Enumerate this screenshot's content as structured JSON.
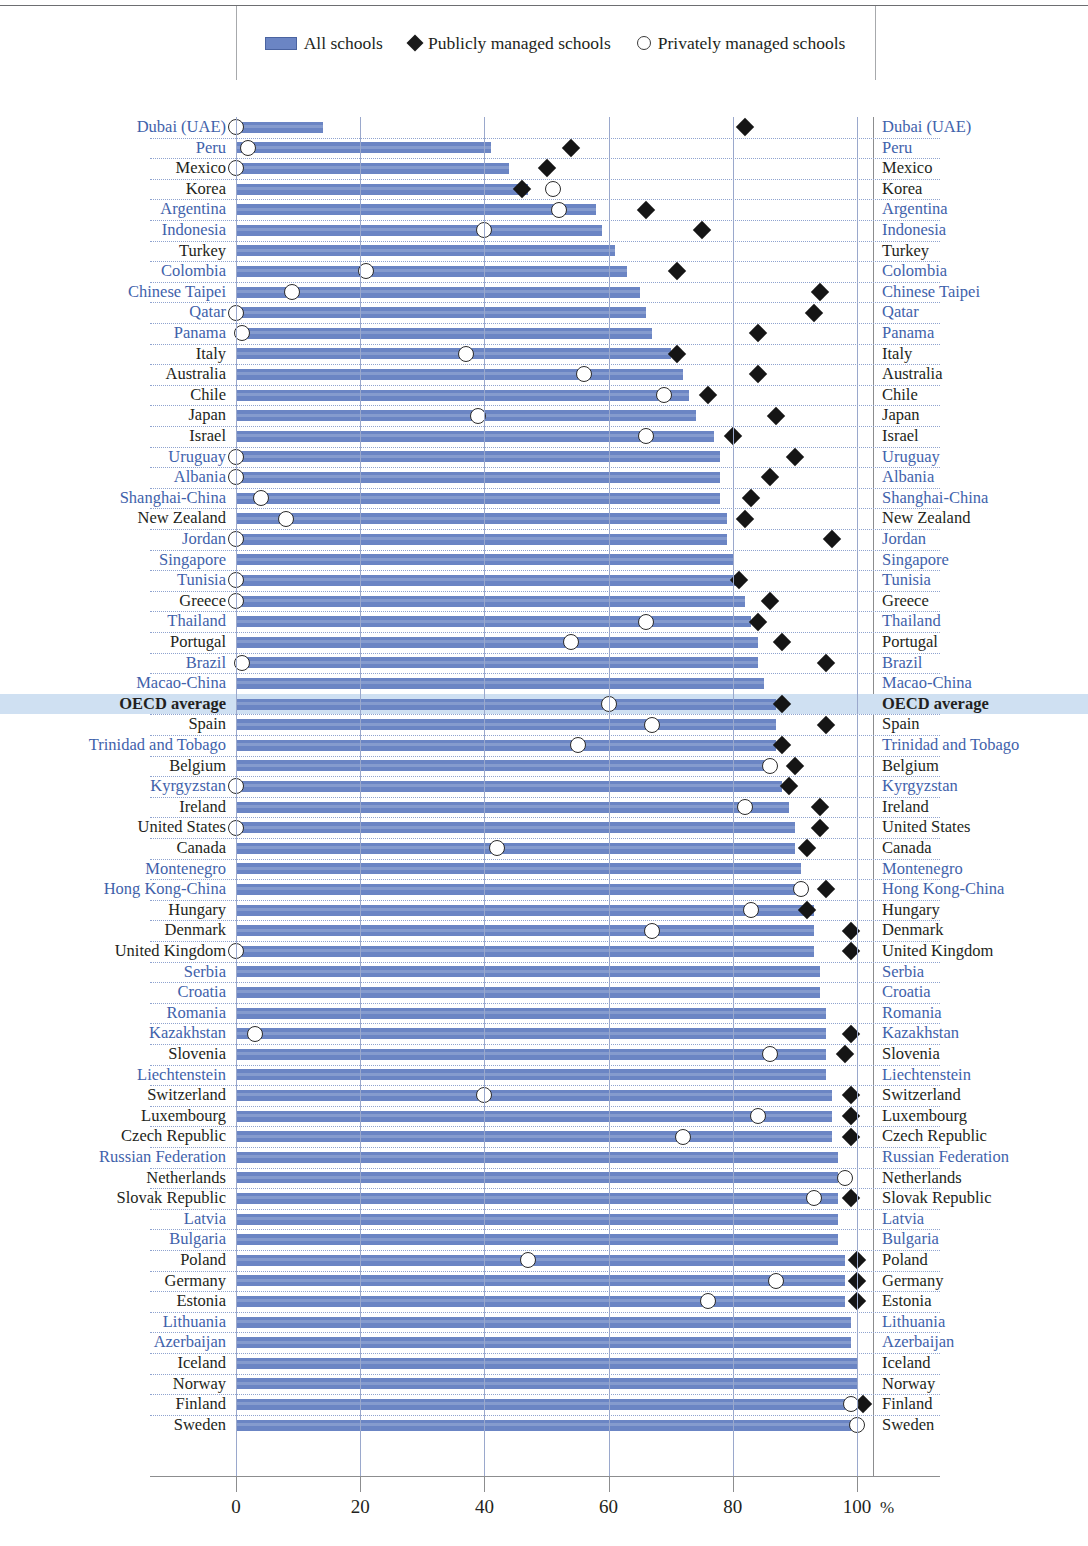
{
  "legend": {
    "items": [
      {
        "key": "all",
        "label": "All schools",
        "marker": "bar-swatch"
      },
      {
        "key": "public",
        "label": "Publicly managed schools",
        "marker": "filled-diamond"
      },
      {
        "key": "private",
        "label": "Privately managed schools",
        "marker": "open-circle"
      }
    ]
  },
  "axis": {
    "ticks": [
      "0",
      "20",
      "40",
      "60",
      "80",
      "100"
    ],
    "unit": "%",
    "min": 0,
    "max": 100
  },
  "chart_data": {
    "type": "bar",
    "title": "",
    "subtitle": "",
    "xlabel": "%",
    "ylabel": "",
    "xlim": [
      0,
      100
    ],
    "grid": "vertical gridlines at 0,20,40,60,80,100; dotted horizontal row separators",
    "legend_position": "top-center",
    "orientation": "horizontal",
    "series": [
      {
        "name": "All schools",
        "marker": "bar"
      },
      {
        "name": "Publicly managed schools",
        "marker": "filled-diamond"
      },
      {
        "name": "Privately managed schools",
        "marker": "open-circle"
      }
    ],
    "highlighted_category": "OECD average",
    "categories": [
      "Dubai (UAE)",
      "Peru",
      "Mexico",
      "Korea",
      "Argentina",
      "Indonesia",
      "Turkey",
      "Colombia",
      "Chinese Taipei",
      "Qatar",
      "Panama",
      "Italy",
      "Australia",
      "Chile",
      "Japan",
      "Israel",
      "Uruguay",
      "Albania",
      "Shanghai-China",
      "New Zealand",
      "Jordan",
      "Singapore",
      "Tunisia",
      "Greece",
      "Thailand",
      "Portugal",
      "Brazil",
      "Macao-China",
      "OECD average",
      "Spain",
      "Trinidad and Tobago",
      "Belgium",
      "Kyrgyzstan",
      "Ireland",
      "United States",
      "Canada",
      "Montenegro",
      "Hong Kong-China",
      "Hungary",
      "Denmark",
      "United Kingdom",
      "Serbia",
      "Croatia",
      "Romania",
      "Kazakhstan",
      "Slovenia",
      "Liechtenstein",
      "Switzerland",
      "Luxembourg",
      "Czech Republic",
      "Russian Federation",
      "Netherlands",
      "Slovak Republic",
      "Latvia",
      "Bulgaria",
      "Poland",
      "Germany",
      "Estonia",
      "Lithuania",
      "Azerbaijan",
      "Iceland",
      "Norway",
      "Finland",
      "Sweden"
    ],
    "rows": [
      {
        "category": "Dubai (UAE)",
        "non_oecd": true,
        "all": 14,
        "public": 82,
        "private": 0
      },
      {
        "category": "Peru",
        "non_oecd": true,
        "all": 41,
        "public": 54,
        "private": 2
      },
      {
        "category": "Mexico",
        "non_oecd": false,
        "all": 44,
        "public": 50,
        "private": 0
      },
      {
        "category": "Korea",
        "non_oecd": false,
        "all": 47,
        "public": 46,
        "private": 51
      },
      {
        "category": "Argentina",
        "non_oecd": true,
        "all": 58,
        "public": 66,
        "private": 52
      },
      {
        "category": "Indonesia",
        "non_oecd": true,
        "all": 59,
        "public": 75,
        "private": 40
      },
      {
        "category": "Turkey",
        "non_oecd": false,
        "all": 61,
        "public": null,
        "private": null
      },
      {
        "category": "Colombia",
        "non_oecd": true,
        "all": 63,
        "public": 71,
        "private": 21
      },
      {
        "category": "Chinese Taipei",
        "non_oecd": true,
        "all": 65,
        "public": 94,
        "private": 9
      },
      {
        "category": "Qatar",
        "non_oecd": true,
        "all": 66,
        "public": 93,
        "private": 0
      },
      {
        "category": "Panama",
        "non_oecd": true,
        "all": 67,
        "public": 84,
        "private": 1
      },
      {
        "category": "Italy",
        "non_oecd": false,
        "all": 70,
        "public": 71,
        "private": 37
      },
      {
        "category": "Australia",
        "non_oecd": false,
        "all": 72,
        "public": 84,
        "private": 56
      },
      {
        "category": "Chile",
        "non_oecd": false,
        "all": 73,
        "public": 76,
        "private": 69
      },
      {
        "category": "Japan",
        "non_oecd": false,
        "all": 74,
        "public": 87,
        "private": 39
      },
      {
        "category": "Israel",
        "non_oecd": false,
        "all": 77,
        "public": 80,
        "private": 66
      },
      {
        "category": "Uruguay",
        "non_oecd": true,
        "all": 78,
        "public": 90,
        "private": 0
      },
      {
        "category": "Albania",
        "non_oecd": true,
        "all": 78,
        "public": 86,
        "private": 0
      },
      {
        "category": "Shanghai-China",
        "non_oecd": true,
        "all": 78,
        "public": 83,
        "private": 4
      },
      {
        "category": "New Zealand",
        "non_oecd": false,
        "all": 79,
        "public": 82,
        "private": 8
      },
      {
        "category": "Jordan",
        "non_oecd": true,
        "all": 79,
        "public": 96,
        "private": 0
      },
      {
        "category": "Singapore",
        "non_oecd": true,
        "all": 80,
        "public": null,
        "private": null
      },
      {
        "category": "Tunisia",
        "non_oecd": true,
        "all": 81,
        "public": 81,
        "private": 0
      },
      {
        "category": "Greece",
        "non_oecd": false,
        "all": 82,
        "public": 86,
        "private": 0
      },
      {
        "category": "Thailand",
        "non_oecd": true,
        "all": 83,
        "public": 84,
        "private": 66
      },
      {
        "category": "Portugal",
        "non_oecd": false,
        "all": 84,
        "public": 88,
        "private": 54
      },
      {
        "category": "Brazil",
        "non_oecd": true,
        "all": 84,
        "public": 95,
        "private": 1
      },
      {
        "category": "Macao-China",
        "non_oecd": true,
        "all": 85,
        "public": null,
        "private": null
      },
      {
        "category": "OECD average",
        "non_oecd": false,
        "all": 87,
        "public": 88,
        "private": 60
      },
      {
        "category": "Spain",
        "non_oecd": false,
        "all": 87,
        "public": 95,
        "private": 67
      },
      {
        "category": "Trinidad and Tobago",
        "non_oecd": true,
        "all": 87,
        "public": 88,
        "private": 55
      },
      {
        "category": "Belgium",
        "non_oecd": false,
        "all": 86,
        "public": 90,
        "private": 86
      },
      {
        "category": "Kyrgyzstan",
        "non_oecd": true,
        "all": 88,
        "public": 89,
        "private": 0
      },
      {
        "category": "Ireland",
        "non_oecd": false,
        "all": 89,
        "public": 94,
        "private": 82
      },
      {
        "category": "United States",
        "non_oecd": false,
        "all": 90,
        "public": 94,
        "private": 0
      },
      {
        "category": "Canada",
        "non_oecd": false,
        "all": 90,
        "public": 92,
        "private": 42
      },
      {
        "category": "Montenegro",
        "non_oecd": true,
        "all": 91,
        "public": null,
        "private": null
      },
      {
        "category": "Hong Kong-China",
        "non_oecd": true,
        "all": 92,
        "public": 95,
        "private": 91
      },
      {
        "category": "Hungary",
        "non_oecd": false,
        "all": 93,
        "public": 92,
        "private": 83
      },
      {
        "category": "Denmark",
        "non_oecd": false,
        "all": 93,
        "public": 99,
        "private": 67
      },
      {
        "category": "United Kingdom",
        "non_oecd": false,
        "all": 93,
        "public": 99,
        "private": 0
      },
      {
        "category": "Serbia",
        "non_oecd": true,
        "all": 94,
        "public": null,
        "private": null
      },
      {
        "category": "Croatia",
        "non_oecd": true,
        "all": 94,
        "public": null,
        "private": null
      },
      {
        "category": "Romania",
        "non_oecd": true,
        "all": 95,
        "public": null,
        "private": null
      },
      {
        "category": "Kazakhstan",
        "non_oecd": true,
        "all": 95,
        "public": 99,
        "private": 3
      },
      {
        "category": "Slovenia",
        "non_oecd": false,
        "all": 95,
        "public": 98,
        "private": 86
      },
      {
        "category": "Liechtenstein",
        "non_oecd": true,
        "all": 95,
        "public": null,
        "private": null
      },
      {
        "category": "Switzerland",
        "non_oecd": false,
        "all": 96,
        "public": 99,
        "private": 40
      },
      {
        "category": "Luxembourg",
        "non_oecd": false,
        "all": 96,
        "public": 99,
        "private": 84
      },
      {
        "category": "Czech Republic",
        "non_oecd": false,
        "all": 96,
        "public": 99,
        "private": 72
      },
      {
        "category": "Russian Federation",
        "non_oecd": true,
        "all": 97,
        "public": null,
        "private": null
      },
      {
        "category": "Netherlands",
        "non_oecd": false,
        "all": 97,
        "public": null,
        "private": 98
      },
      {
        "category": "Slovak Republic",
        "non_oecd": false,
        "all": 97,
        "public": 99,
        "private": 93
      },
      {
        "category": "Latvia",
        "non_oecd": true,
        "all": 97,
        "public": null,
        "private": null
      },
      {
        "category": "Bulgaria",
        "non_oecd": true,
        "all": 97,
        "public": null,
        "private": null
      },
      {
        "category": "Poland",
        "non_oecd": false,
        "all": 98,
        "public": 100,
        "private": 47
      },
      {
        "category": "Germany",
        "non_oecd": false,
        "all": 98,
        "public": 100,
        "private": 87
      },
      {
        "category": "Estonia",
        "non_oecd": false,
        "all": 98,
        "public": 100,
        "private": 76
      },
      {
        "category": "Lithuania",
        "non_oecd": true,
        "all": 99,
        "public": null,
        "private": null
      },
      {
        "category": "Azerbaijan",
        "non_oecd": true,
        "all": 99,
        "public": null,
        "private": null
      },
      {
        "category": "Iceland",
        "non_oecd": false,
        "all": 100,
        "public": null,
        "private": null
      },
      {
        "category": "Norway",
        "non_oecd": false,
        "all": 100,
        "public": null,
        "private": null
      },
      {
        "category": "Finland",
        "non_oecd": false,
        "all": 100,
        "public": 101,
        "private": 99
      },
      {
        "category": "Sweden",
        "non_oecd": false,
        "all": 100,
        "public": null,
        "private": 100
      }
    ]
  }
}
